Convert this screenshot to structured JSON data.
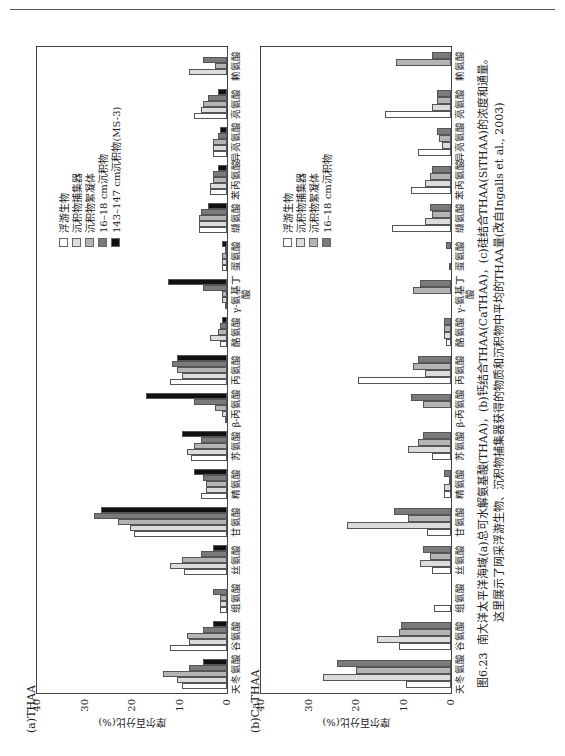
{
  "header": {
    "running_text": ""
  },
  "legend": {
    "series": [
      {
        "name": "浮游生物",
        "color": "#ffffff"
      },
      {
        "name": "沉积物捕集器",
        "color": "#dcdcdc"
      },
      {
        "name": "沉积物絮凝体",
        "color": "#b4b4b4"
      },
      {
        "name": "16–18 cm沉积物",
        "color": "#7a7a7a"
      },
      {
        "name": "143–147 cm沉积物(MS-3)",
        "color": "#111111"
      }
    ]
  },
  "caption": {
    "label": "图6.23",
    "line1": "南大洋太平洋海域(a)总可水解氨基酸(THAA)，(b)钙结合THAA(CaTHAA)，(c)硅结合THAA(SiTHAA)的浓度和通量。",
    "line2": "这里展示了网采浮游生物、沉积物捕集器获得的物质和沉积物中平均的THAA量(改自Ingalls et al., 2003)"
  },
  "chart_data": [
    {
      "type": "bar",
      "title": "(a)THAA",
      "xlabel": "",
      "ylabel": "摩尔百分比(%)",
      "ylim": [
        0,
        40
      ],
      "yticks": [
        0,
        10,
        20,
        30,
        40
      ],
      "categories": [
        "天冬氨酸",
        "谷氨酸",
        "组氨酸",
        "丝氨酸",
        "甘氨酸",
        "精氨酸",
        "苏氨酸",
        "β-丙氨酸",
        "丙氨酸",
        "酪氨酸",
        "γ-氨基丁酸",
        "蛋氨酸",
        "缬氨酸",
        "苯丙氨酸",
        "异亮氨酸",
        "亮氨酸",
        "赖氨酸"
      ],
      "series": [
        {
          "name": "浮游生物",
          "values": [
            9.5,
            12,
            1.5,
            9,
            19.5,
            5.5,
            7.5,
            0.5,
            12,
            1.5,
            0.5,
            1,
            6,
            3.5,
            3,
            7,
            0
          ]
        },
        {
          "name": "沉积物捕集器",
          "values": [
            10.5,
            8,
            1.5,
            12,
            20.5,
            4.5,
            8.5,
            1,
            9.5,
            3.5,
            1,
            1,
            6,
            3.5,
            3,
            5.5,
            8
          ]
        },
        {
          "name": "沉积物絮凝体",
          "values": [
            13.5,
            8.5,
            1.5,
            9.5,
            23,
            4.5,
            7,
            2.5,
            10.5,
            2,
            1,
            1,
            6,
            3,
            3,
            5,
            2.5
          ]
        },
        {
          "name": "16–18 cm沉积物",
          "values": [
            8,
            5,
            3,
            5.5,
            28,
            5,
            5.5,
            7,
            11.5,
            1.5,
            5,
            0.5,
            5.5,
            3,
            2,
            4,
            5
          ]
        },
        {
          "name": "143–147 cm沉积物(MS-3)",
          "values": [
            5,
            3,
            0,
            3,
            26.5,
            7,
            9.5,
            17,
            10.5,
            1,
            12.5,
            1,
            4,
            2,
            1.5,
            2,
            0
          ]
        }
      ],
      "legend_position": "upper-right",
      "grid": false,
      "error_bars": true
    },
    {
      "type": "bar",
      "title": "(b)CaTHAA",
      "xlabel": "",
      "ylabel": "摩尔百分比(%)",
      "ylim": [
        0,
        40
      ],
      "yticks": [
        0,
        10,
        20,
        30,
        40
      ],
      "categories": [
        "天冬氨酸",
        "谷氨酸",
        "组氨酸",
        "丝氨酸",
        "甘氨酸",
        "精氨酸",
        "苏氨酸",
        "β-丙氨酸",
        "丙氨酸",
        "酪氨酸",
        "γ-氨基丁酸",
        "蛋氨酸",
        "缬氨酸",
        "苯丙氨酸",
        "异亮氨酸",
        "亮氨酸",
        "赖氨酸"
      ],
      "series": [
        {
          "name": "浮游生物",
          "values": [
            9.5,
            11,
            3.5,
            4,
            5,
            1.5,
            4,
            0,
            19.5,
            1,
            0,
            0.5,
            12.5,
            8.5,
            7,
            14,
            0
          ]
        },
        {
          "name": "沉积物捕集器",
          "values": [
            27,
            15.5,
            0,
            6.5,
            22,
            1.5,
            9,
            0,
            5.5,
            1.5,
            0,
            0,
            5.5,
            5.5,
            2,
            4,
            0
          ]
        },
        {
          "name": "沉积物絮凝体",
          "values": [
            20,
            11,
            0,
            4.5,
            9,
            0.5,
            7,
            6,
            8,
            1.5,
            8,
            0,
            4,
            4.5,
            2.5,
            3,
            11.5
          ]
        },
        {
          "name": "16–18 cm沉积物",
          "values": [
            24,
            10.5,
            0,
            6,
            12,
            1.5,
            6,
            8.5,
            7,
            1.5,
            6.5,
            1,
            4.5,
            4,
            3,
            3,
            4
          ]
        }
      ],
      "legend_position": "upper-right",
      "grid": false,
      "error_bars": true
    }
  ]
}
